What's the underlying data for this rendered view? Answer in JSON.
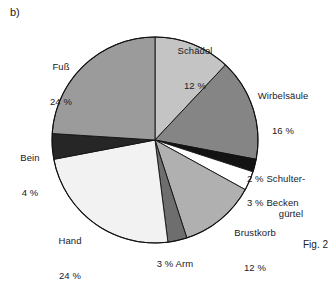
{
  "panel": {
    "letter": "b)"
  },
  "caption": {
    "text": "Fig. 2"
  },
  "chart_data": {
    "type": "pie",
    "title": "",
    "subtitle": "",
    "xlabel": "",
    "ylabel": "",
    "grid": false,
    "legend_position": "none",
    "units": "%",
    "start_angle_deg": 0,
    "direction": "clockwise",
    "center": {
      "x": 155,
      "y": 140
    },
    "radius": 103,
    "categories": [
      "Schädel",
      "Wirbelsäule",
      "Schultergürtel",
      "Becken",
      "Brustkorb",
      "Arm",
      "Hand",
      "Bein",
      "Fuß"
    ],
    "values": [
      12,
      16,
      2,
      3,
      12,
      3,
      24,
      4,
      24
    ],
    "colors": [
      "#c4c4c4",
      "#858585",
      "#131313",
      "#ffffff",
      "#b0b0b0",
      "#6e6e6e",
      "#f2f2f2",
      "#262626",
      "#9b9b9b"
    ],
    "slices": [
      {
        "name": "Schädel",
        "value": 12,
        "label": "Schädel",
        "value_label": "12 %",
        "color": "#c4c4c4"
      },
      {
        "name": "Wirbelsäule",
        "value": 16,
        "label": "Wirbelsäule",
        "value_label": "16 %",
        "color": "#858585"
      },
      {
        "name": "Schultergürtel",
        "value": 2,
        "label": "Schultergürtel",
        "value_label": "2 %",
        "color": "#131313"
      },
      {
        "name": "Becken",
        "value": 3,
        "label": "Becken",
        "value_label": "3 %",
        "color": "#ffffff"
      },
      {
        "name": "Brustkorb",
        "value": 12,
        "label": "Brustkorb",
        "value_label": "12 %",
        "color": "#b0b0b0"
      },
      {
        "name": "Arm",
        "value": 3,
        "label": "Arm",
        "value_label": "3 %",
        "color": "#6e6e6e"
      },
      {
        "name": "Hand",
        "value": 24,
        "label": "Hand",
        "value_label": "24 %",
        "color": "#f2f2f2"
      },
      {
        "name": "Bein",
        "value": 4,
        "label": "Bein",
        "value_label": "4 %",
        "color": "#262626"
      },
      {
        "name": "Fuß",
        "value": 24,
        "label": "Fuß",
        "value_label": "24 %",
        "color": "#9b9b9b"
      }
    ]
  },
  "labels": {
    "schaedel": {
      "line1": "Schädel",
      "line2": "12 %"
    },
    "wirbelsaeule": {
      "line1": "Wirbelsäule",
      "line2": "16 %"
    },
    "schulterguertel": {
      "line1": "2 % Schulter-",
      "line2": "gürtel"
    },
    "becken": {
      "line1": "3 % Becken"
    },
    "brustkorb": {
      "line1": "Brustkorb",
      "line2": "12 %"
    },
    "arm": {
      "line1": "3 % Arm"
    },
    "hand": {
      "line1": "Hand",
      "line2": "24 %"
    },
    "bein": {
      "line1": "Bein",
      "line2": "4 %"
    },
    "fuss": {
      "line1": "Fuß",
      "line2": "24 %"
    }
  }
}
